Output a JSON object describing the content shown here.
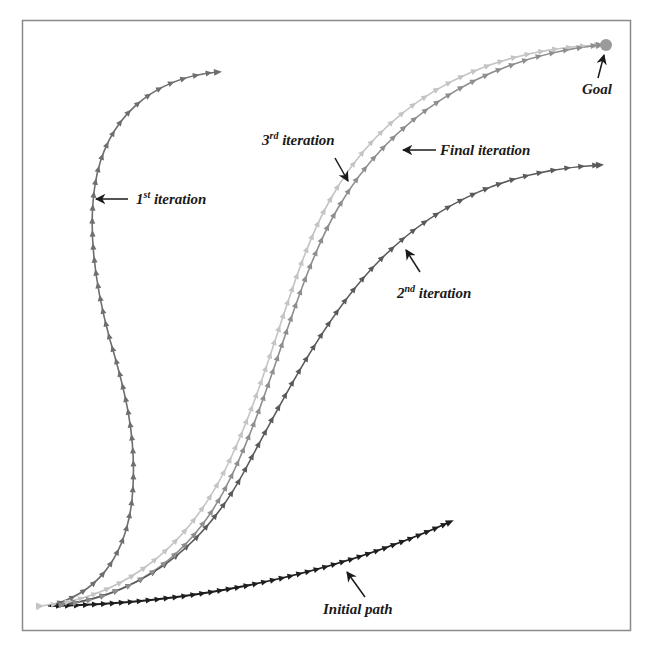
{
  "figure": {
    "type": "path-iteration-diagram",
    "frame_color": "#8a8a8a",
    "background": "#ffffff"
  },
  "labels": {
    "goal": "Goal",
    "first": {
      "num": "1",
      "sup": "st",
      "text": " iteration"
    },
    "second": {
      "num": "2",
      "sup": "nd",
      "text": " iteration"
    },
    "third": {
      "num": "3",
      "sup": "rd",
      "text": " iteration"
    },
    "final": "Final iteration",
    "initial": "Initial path"
  },
  "paths": [
    {
      "name": "Initial path",
      "color": "#1e1e1e",
      "start": [
        45,
        606
      ],
      "end": [
        450,
        522
      ]
    },
    {
      "name": "1st iteration",
      "color": "#6e6e6e",
      "start": [
        45,
        606
      ],
      "end": [
        218,
        72
      ]
    },
    {
      "name": "2nd iteration",
      "color": "#5a5a5a",
      "start": [
        45,
        606
      ],
      "end": [
        600,
        165
      ]
    },
    {
      "name": "3rd iteration",
      "color": "#c4c4c4",
      "start": [
        45,
        606
      ],
      "end": [
        600,
        45
      ]
    },
    {
      "name": "Final iteration",
      "color": "#8e8e8e",
      "start": [
        45,
        606
      ],
      "end": [
        600,
        45
      ]
    }
  ],
  "goal_marker": {
    "position": [
      606,
      45
    ],
    "color": "#9a9a9a"
  }
}
